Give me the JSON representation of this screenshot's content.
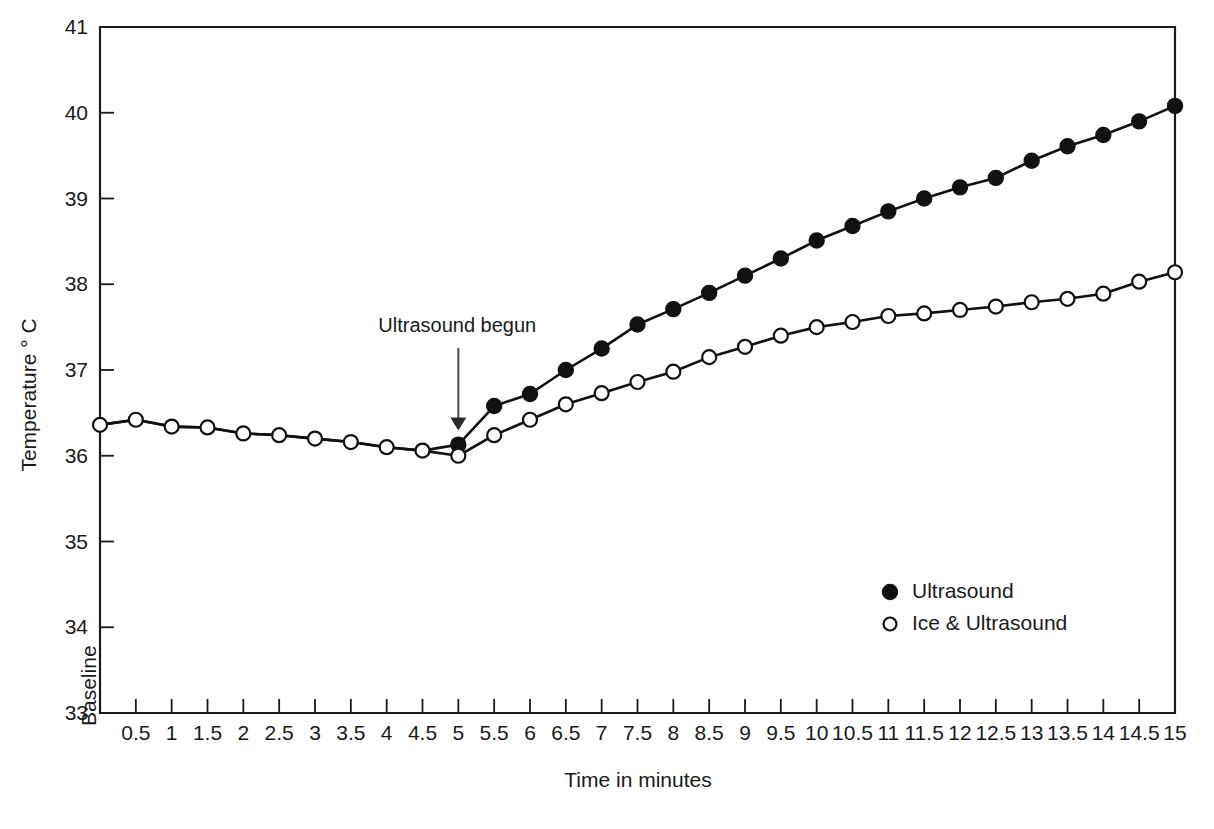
{
  "chart_data": {
    "type": "line",
    "title": "",
    "xlabel": "Time in minutes",
    "ylabel": "Temperature ° C",
    "ylim": [
      33,
      41
    ],
    "yticks": [
      33,
      34,
      35,
      36,
      37,
      38,
      39,
      40,
      41
    ],
    "grid": false,
    "legend_position": "inside-lower-right",
    "categories": [
      "Baseline",
      "0.5",
      "1",
      "1.5",
      "2",
      "2.5",
      "3",
      "3.5",
      "4",
      "4.5",
      "5",
      "5.5",
      "6",
      "6.5",
      "7",
      "7.5",
      "8",
      "8.5",
      "9",
      "9.5",
      "10",
      "10.5",
      "11",
      "11.5",
      "12",
      "12.5",
      "13",
      "13.5",
      "14",
      "14.5",
      "15"
    ],
    "annotations": [
      {
        "text": "Ultrasound begun",
        "at_category": "5",
        "arrow": "down"
      }
    ],
    "series": [
      {
        "name": "Ultrasound",
        "marker": "filled-circle",
        "color": "#111111",
        "values": [
          36.36,
          36.42,
          36.34,
          36.33,
          36.26,
          36.24,
          36.2,
          36.16,
          36.1,
          36.06,
          36.13,
          36.58,
          36.72,
          37.0,
          37.25,
          37.53,
          37.71,
          37.9,
          38.1,
          38.3,
          38.51,
          38.68,
          38.85,
          39.0,
          39.13,
          39.24,
          39.44,
          39.61,
          39.74,
          39.9,
          40.08
        ]
      },
      {
        "name": "Ice & Ultrasound",
        "marker": "open-circle",
        "color": "#111111",
        "values": [
          36.36,
          36.42,
          36.34,
          36.33,
          36.26,
          36.24,
          36.2,
          36.16,
          36.1,
          36.06,
          36.0,
          36.24,
          36.42,
          36.6,
          36.73,
          36.86,
          36.98,
          37.15,
          37.27,
          37.4,
          37.5,
          37.56,
          37.63,
          37.66,
          37.7,
          37.74,
          37.79,
          37.83,
          37.89,
          38.03,
          38.14
        ]
      }
    ]
  },
  "legend": {
    "entries": [
      {
        "label": "Ultrasound",
        "marker": "filled-circle"
      },
      {
        "label": "Ice & Ultrasound",
        "marker": "open-circle"
      }
    ]
  },
  "axes": {
    "y_title": "Temperature ° C",
    "x_title": "Time in minutes",
    "baseline_label": "Baseline"
  }
}
